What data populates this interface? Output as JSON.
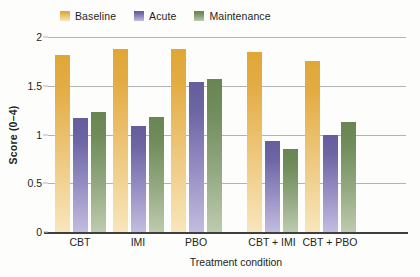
{
  "chart_data": {
    "type": "bar",
    "title": "",
    "xlabel": "Treatment condition",
    "ylabel": "Score (0–4)",
    "ylim": [
      0,
      2
    ],
    "yticks": [
      "0",
      "0.5",
      "1",
      "1.5",
      "2"
    ],
    "ytick_values": [
      0,
      0.5,
      1,
      1.5,
      2
    ],
    "grid": true,
    "legend_position": "top-left",
    "categories": [
      "CBT",
      "IMI",
      "PBO",
      "CBT + IMI",
      "CBT + PBO"
    ],
    "series": [
      {
        "name": "Baseline",
        "color": "#e0a737",
        "values": [
          1.82,
          1.88,
          1.88,
          1.85,
          1.75
        ]
      },
      {
        "name": "Acute",
        "color": "#655d9c",
        "values": [
          1.17,
          1.09,
          1.54,
          0.93,
          1.0
        ]
      },
      {
        "name": "Maintenance",
        "color": "#688553",
        "values": [
          1.23,
          1.18,
          1.57,
          0.85,
          1.13
        ]
      }
    ],
    "group_gap_after": 2
  },
  "legend": {
    "items": [
      {
        "label": "Baseline",
        "swatch": "baseline-swatch"
      },
      {
        "label": "Acute",
        "swatch": "acute-swatch"
      },
      {
        "label": "Maintenance",
        "swatch": "maintenance-swatch"
      }
    ]
  },
  "axes": {
    "y_title": "Score (0–4)",
    "x_title": "Treatment condition",
    "y_ticks": [
      "2",
      "1.5",
      "1",
      "0.5",
      "0"
    ]
  },
  "colors": {
    "baseline": "#e0a737",
    "acute": "#655d9c",
    "maintenance": "#688553",
    "gridline": "#b3b3b1",
    "axis": "#3f3f3f",
    "text": "#231f20",
    "background": "#fdfdfc"
  }
}
